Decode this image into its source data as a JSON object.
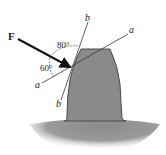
{
  "diagram": {
    "type": "gear-tooth-force",
    "force": {
      "label": "F"
    },
    "axes": {
      "a_top": "a",
      "a_bottom": "a",
      "b_top": "b",
      "b_bottom": "b"
    },
    "angles": {
      "upper": "80°",
      "lower": "60°"
    },
    "colors": {
      "tooth_fill": "#8a8a8a",
      "tooth_edge": "#4a4a4a",
      "lines": "#333333",
      "arrow": "#111111",
      "background": "#ffffff"
    }
  }
}
